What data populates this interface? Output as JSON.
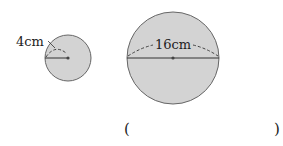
{
  "diagram": {
    "small_circle": {
      "label": "4cm",
      "dimension": "radius",
      "fill": "#d3d3d3",
      "stroke": "#555555"
    },
    "large_circle": {
      "label": "16cm",
      "dimension": "diameter",
      "fill": "#d3d3d3",
      "stroke": "#555555"
    },
    "answer": {
      "open": "(",
      "close": ")"
    }
  }
}
